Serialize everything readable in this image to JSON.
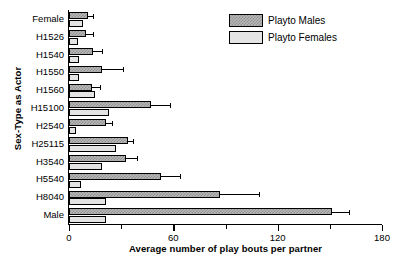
{
  "chart_data": {
    "type": "bar",
    "orientation": "horizontal",
    "title": "",
    "xlabel": "Average number of play bouts per partner",
    "ylabel": "Sex-Type as Actor",
    "xlim": [
      0,
      180
    ],
    "xticks": [
      0,
      60,
      120,
      180
    ],
    "xticklabels": [
      "0",
      "60",
      "120",
      "180"
    ],
    "xminorticks": [
      30,
      90,
      150
    ],
    "grid": false,
    "legend_position": "top-right",
    "categories": [
      "Female",
      "H1526",
      "H1540",
      "H1550",
      "H1560",
      "H15100",
      "H2540",
      "H25115",
      "H3540",
      "H5540",
      "H8040",
      "Male"
    ],
    "series": [
      {
        "name": "Playto Males",
        "values": [
          11,
          10,
          14,
          19,
          13,
          47,
          21,
          34,
          33,
          53,
          87,
          151
        ],
        "errors": [
          3,
          4,
          5,
          12,
          5,
          11,
          4,
          3,
          6,
          11,
          22,
          10
        ]
      },
      {
        "name": "Playto Females",
        "values": [
          8,
          5,
          6,
          6,
          15,
          23,
          4,
          27,
          19,
          7,
          21,
          21
        ]
      }
    ],
    "legend": [
      "Playto Males",
      "Playto Females"
    ]
  },
  "legend": {
    "males_label": "Playto Males",
    "females_label": "Playto Females"
  },
  "axes": {
    "x_label": "Average number of play bouts per partner",
    "y_label": "Sex-Type as Actor",
    "x_tick_0": "0",
    "x_tick_1": "60",
    "x_tick_2": "120",
    "x_tick_3": "180"
  },
  "colors": {
    "males_fill": "#b9b9b9",
    "females_fill": "#e4e4e4",
    "axis": "#000000"
  }
}
